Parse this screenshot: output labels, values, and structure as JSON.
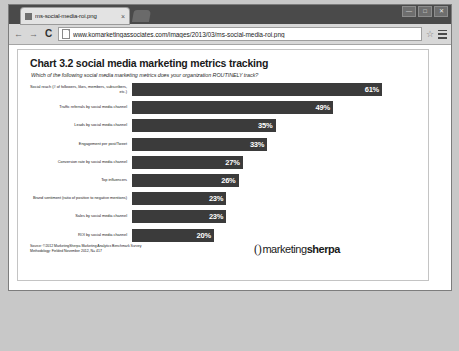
{
  "browser": {
    "tab": {
      "title": "ms-social-media-roi.png",
      "close_label": "×",
      "favicon_name": "image-file-icon"
    },
    "new_tab_label": "+",
    "window_controls": [
      {
        "name": "minimize",
        "glyph": "—"
      },
      {
        "name": "maximize",
        "glyph": "□"
      },
      {
        "name": "close",
        "glyph": "✕"
      }
    ],
    "toolbar": {
      "back_glyph": "←",
      "forward_glyph": "→",
      "reload_glyph": "C",
      "url": "www.komarketingassociates.com/images/2013/03/ms-social-media-roi.png",
      "star_glyph": "☆"
    }
  },
  "chart_data": {
    "type": "bar",
    "orientation": "horizontal",
    "title": "Chart 3.2 social media marketing metrics tracking",
    "subtitle": "Which of the following social media marketing metrics does your organization ROUTINELY track?",
    "xlabel": "",
    "ylabel": "",
    "xlim": [
      0,
      70
    ],
    "grid": false,
    "legend": false,
    "bar_color": "#3b3b3b",
    "value_suffix": "%",
    "categories": [
      "Social reach (# of followers, likes, members, subscribers, etc.)",
      "Traffic referrals by social media channel",
      "Leads by social media channel",
      "Engagement per post/Tweet",
      "Conversion rate by social media channel",
      "Top influencers",
      "Brand sentiment (ratio of positive to negative mentions)",
      "Sales by social media channel",
      "ROI by social media channel"
    ],
    "values": [
      61,
      49,
      35,
      33,
      27,
      26,
      23,
      23,
      20
    ],
    "value_labels": [
      "61%",
      "49%",
      "35%",
      "33%",
      "27%",
      "26%",
      "23%",
      "23%",
      "20%"
    ],
    "source_lines": [
      "Source: ©2012 MarketingSherpa Marketing Analytics Benchmark Survey",
      "Methodology: Fielded November 2012, N= 417"
    ],
    "logo": {
      "mark": "⟨⟩",
      "light": "marketing",
      "bold": "sherpa"
    }
  }
}
